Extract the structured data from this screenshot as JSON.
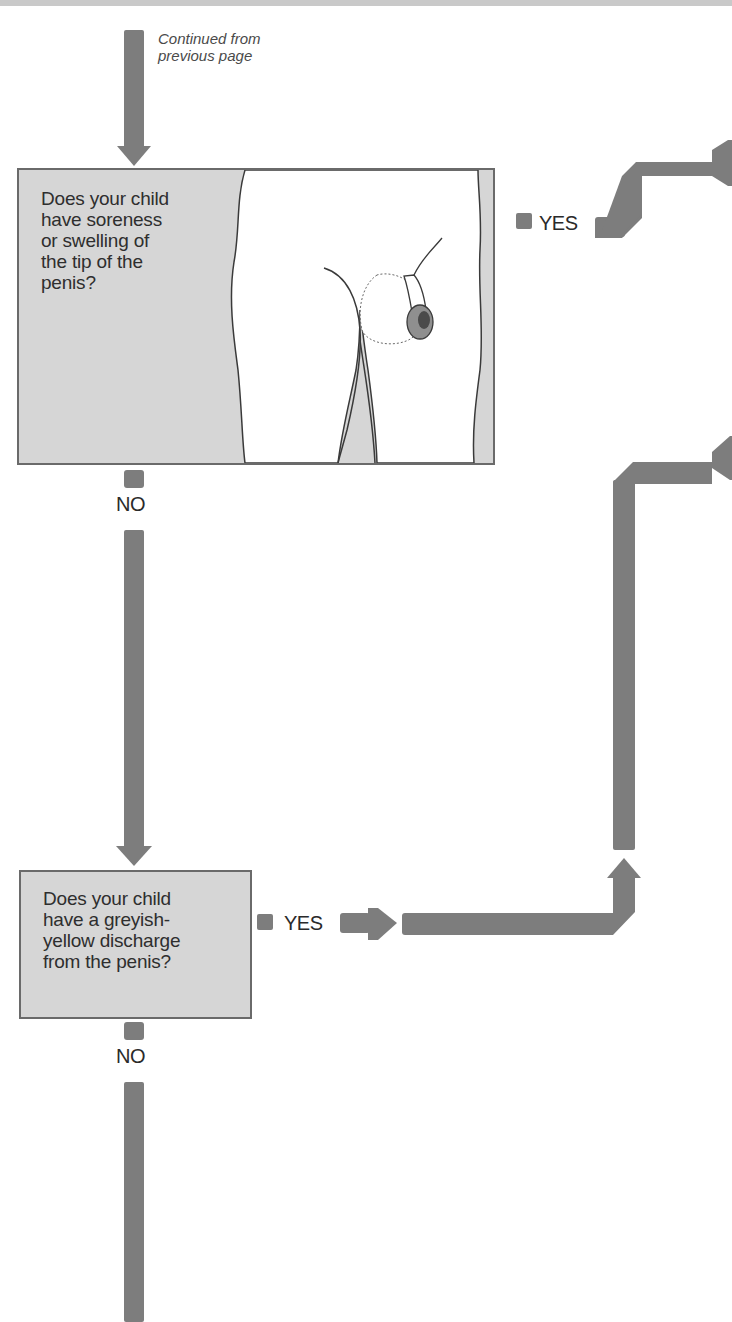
{
  "page": {
    "continued_note": "Continued from\nprevious page"
  },
  "question1": {
    "text": "Does your child\nhave soreness\nor swelling of\nthe tip of the\npenis?",
    "illustration": "illustration of swollen penis tip",
    "yes_label": "YES",
    "no_label": "NO"
  },
  "question2": {
    "text": "Does your child\nhave a greyish-\nyellow discharge\nfrom the penis?",
    "yes_label": "YES",
    "no_label": "NO"
  },
  "colors": {
    "arrow": "#7d7d7d",
    "box_fill": "#d6d6d6",
    "box_border": "#6a6a6a"
  }
}
